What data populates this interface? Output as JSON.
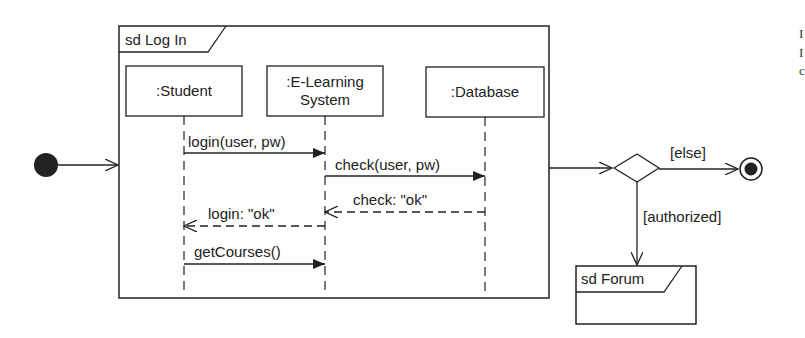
{
  "diagram": {
    "type": "UML interaction overview",
    "login_frame": {
      "label": "sd Log In",
      "lifelines": [
        {
          "name": ":Student"
        },
        {
          "name_line1": ":E-Learning",
          "name_line2": "System"
        },
        {
          "name": ":Database"
        }
      ],
      "messages": [
        {
          "label": "login(user, pw)",
          "from": ":Student",
          "to": ":E-Learning System",
          "kind": "sync"
        },
        {
          "label": "check(user, pw)",
          "from": ":E-Learning System",
          "to": ":Database",
          "kind": "sync"
        },
        {
          "label": "check: \"ok\"",
          "from": ":Database",
          "to": ":E-Learning System",
          "kind": "reply"
        },
        {
          "label": "login: \"ok\"",
          "from": ":E-Learning System",
          "to": ":Student",
          "kind": "reply"
        },
        {
          "label": "getCourses()",
          "from": ":Student",
          "to": ":E-Learning System",
          "kind": "sync"
        }
      ]
    },
    "decision": {
      "else_guard": "[else]",
      "authorized_guard": "[authorized]"
    },
    "forum_frame": {
      "label": "sd Forum"
    },
    "edge_text_fragments": [
      "I",
      "I",
      "c"
    ]
  }
}
